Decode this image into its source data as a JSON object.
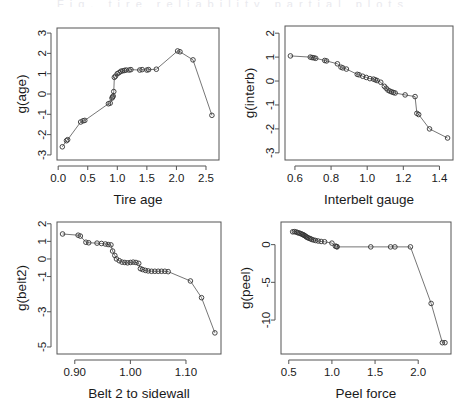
{
  "figure": {
    "background": "#ffffff",
    "line_color": "#666666",
    "point_color": "#333333",
    "axis_color": "#555555",
    "header_fragment": "Fig. tire reliability partial plots"
  },
  "chart_data": [
    {
      "type": "line",
      "panel": "top-left",
      "title": "",
      "xlabel": "Tire age",
      "ylabel": "g(age)",
      "xlim": [
        -0.02,
        2.72
      ],
      "ylim": [
        -3.25,
        3.25
      ],
      "xticks": [
        0.0,
        0.5,
        1.0,
        1.5,
        2.0,
        2.5
      ],
      "xticklabels": [
        "0.0",
        "0.5",
        "1.0",
        "1.5",
        "2.0",
        "2.5"
      ],
      "yticks": [
        -3,
        -2,
        -1,
        0,
        1,
        2,
        3
      ],
      "yticklabels": [
        "-3",
        "-2",
        "-1",
        "0",
        "1",
        "2",
        "3"
      ],
      "grid": false,
      "legend": "none",
      "marker": "open-circle",
      "x": [
        0.07,
        0.14,
        0.16,
        0.38,
        0.42,
        0.45,
        0.85,
        0.88,
        0.91,
        0.92,
        0.93,
        0.94,
        0.95,
        0.97,
        1.0,
        1.03,
        1.06,
        1.09,
        1.12,
        1.15,
        1.2,
        1.23,
        1.38,
        1.42,
        1.5,
        1.53,
        1.66,
        2.02,
        2.06,
        2.28,
        2.6
      ],
      "y": [
        -2.6,
        -2.3,
        -2.25,
        -1.38,
        -1.32,
        -1.3,
        -0.48,
        -0.45,
        -0.2,
        -0.15,
        -0.1,
        0.12,
        0.82,
        0.88,
        1.0,
        1.05,
        1.12,
        1.14,
        1.16,
        1.18,
        1.18,
        1.2,
        1.18,
        1.2,
        1.18,
        1.2,
        1.22,
        2.12,
        2.08,
        1.68,
        -1.05
      ]
    },
    {
      "type": "line",
      "panel": "top-right",
      "title": "",
      "xlabel": "Interbelt gauge",
      "ylabel": "g(interb)",
      "xlim": [
        0.545,
        1.475
      ],
      "ylim": [
        -3.3,
        2.3
      ],
      "xticks": [
        0.6,
        0.8,
        1.0,
        1.2,
        1.4
      ],
      "xticklabels": [
        "0.6",
        "0.8",
        "1.0",
        "1.2",
        "1.4"
      ],
      "yticks": [
        -3,
        -2,
        -1,
        0,
        1,
        2
      ],
      "yticklabels": [
        "-3",
        "-2",
        "-1",
        "0",
        "1",
        "2"
      ],
      "grid": false,
      "legend": "none",
      "marker": "open-circle",
      "x": [
        0.575,
        0.685,
        0.695,
        0.705,
        0.715,
        0.765,
        0.775,
        0.835,
        0.855,
        0.865,
        0.885,
        0.945,
        0.955,
        0.975,
        0.995,
        1.015,
        1.035,
        1.045,
        1.055,
        1.075,
        1.095,
        1.105,
        1.115,
        1.125,
        1.135,
        1.145,
        1.155,
        1.21,
        1.265,
        1.275,
        1.285,
        1.345,
        1.445
      ],
      "y": [
        1.05,
        1.0,
        0.98,
        0.97,
        0.95,
        0.86,
        0.84,
        0.72,
        0.58,
        0.55,
        0.5,
        0.28,
        0.26,
        0.2,
        0.15,
        0.1,
        0.08,
        0.05,
        0.02,
        -0.05,
        -0.22,
        -0.3,
        -0.38,
        -0.42,
        -0.45,
        -0.48,
        -0.5,
        -0.58,
        -0.65,
        -1.35,
        -1.4,
        -2.0,
        -2.38
      ]
    },
    {
      "type": "line",
      "panel": "bottom-left",
      "title": "",
      "xlabel": "Belt 2 to sidewall",
      "ylabel": "g(belt2)",
      "xlim": [
        0.868,
        1.163
      ],
      "ylim": [
        -5.4,
        2.1
      ],
      "xticks": [
        0.9,
        1.0,
        1.1
      ],
      "xticklabels": [
        "0.90",
        "1.00",
        "1.10"
      ],
      "yticks": [
        -5,
        -3,
        -1,
        0,
        1,
        2
      ],
      "yticklabels": [
        "-5",
        "-3",
        "-1",
        "0",
        "1",
        "2"
      ],
      "grid": false,
      "legend": "none",
      "marker": "open-circle",
      "x": [
        0.878,
        0.906,
        0.91,
        0.92,
        0.925,
        0.94,
        0.948,
        0.955,
        0.96,
        0.965,
        0.968,
        0.972,
        0.975,
        0.98,
        0.985,
        0.99,
        0.995,
        1.0,
        1.005,
        1.01,
        1.015,
        1.018,
        1.022,
        1.027,
        1.032,
        1.038,
        1.044,
        1.05,
        1.056,
        1.062,
        1.068,
        1.108,
        1.128,
        1.152
      ],
      "y": [
        1.42,
        1.35,
        1.3,
        0.95,
        0.92,
        0.9,
        0.88,
        0.85,
        0.82,
        0.8,
        0.45,
        0.2,
        0.0,
        -0.1,
        -0.18,
        -0.2,
        -0.22,
        -0.2,
        -0.18,
        -0.2,
        -0.25,
        -0.55,
        -0.6,
        -0.65,
        -0.68,
        -0.7,
        -0.7,
        -0.7,
        -0.7,
        -0.7,
        -0.72,
        -1.25,
        -2.2,
        -4.2
      ]
    },
    {
      "type": "line",
      "panel": "bottom-right",
      "title": "",
      "xlabel": "Peel force",
      "ylabel": "g(peel)",
      "xlim": [
        0.41,
        2.38
      ],
      "ylim": [
        -14.5,
        3.0
      ],
      "xticks": [
        0.5,
        1.0,
        1.5,
        2.0
      ],
      "xticklabels": [
        "0.5",
        "1.0",
        "1.5",
        "2.0"
      ],
      "yticks": [
        -10,
        -5,
        0
      ],
      "yticklabels": [
        "-10",
        "-5",
        "0"
      ],
      "grid": false,
      "legend": "none",
      "marker": "open-circle",
      "x": [
        0.545,
        0.565,
        0.585,
        0.6,
        0.615,
        0.63,
        0.645,
        0.66,
        0.672,
        0.684,
        0.696,
        0.708,
        0.72,
        0.735,
        0.75,
        0.765,
        0.785,
        0.81,
        0.84,
        0.875,
        0.915,
        1.0,
        1.04,
        1.055,
        1.06,
        1.45,
        1.68,
        1.73,
        1.91,
        2.15,
        2.28,
        2.31
      ],
      "y": [
        1.7,
        1.72,
        1.68,
        1.6,
        1.55,
        1.5,
        1.42,
        1.35,
        1.28,
        1.2,
        1.1,
        1.0,
        0.92,
        0.85,
        0.78,
        0.7,
        0.62,
        0.55,
        0.48,
        0.42,
        0.38,
        0.2,
        -0.2,
        -0.25,
        -0.3,
        -0.3,
        -0.3,
        -0.3,
        -0.3,
        -7.8,
        -13.0,
        -13.0
      ]
    }
  ]
}
